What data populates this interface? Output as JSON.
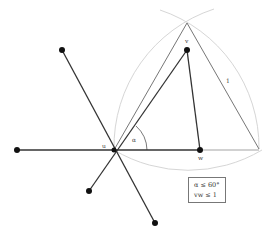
{
  "diagram": {
    "points": {
      "u": {
        "label": "u",
        "x": 114,
        "y": 150
      },
      "v": {
        "label": "v",
        "x": 187,
        "y": 50
      },
      "w": {
        "label": "w",
        "x": 200,
        "y": 150
      },
      "left": {
        "x": 17,
        "y": 150
      },
      "upper_left": {
        "x": 62,
        "y": 50
      },
      "lower_left": {
        "x": 89,
        "y": 191
      },
      "bottom": {
        "x": 155,
        "y": 223
      }
    },
    "triangle": {
      "apex": [
        187,
        23
      ],
      "left": [
        114,
        150
      ],
      "right": [
        259,
        149
      ],
      "side_label": "1"
    },
    "angle_label": "α",
    "constraints": [
      "α ≤ 60°",
      "vw ≤ 1"
    ],
    "colors": {
      "edge": "#333333",
      "triangle": "#666666",
      "arc": "#d6d6d6",
      "node": "#111111"
    }
  }
}
